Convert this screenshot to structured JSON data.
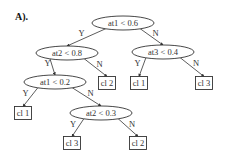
{
  "panel_label": "A).",
  "nodes": [
    {
      "id": "n0",
      "type": "decision",
      "label": "at1 < 0.6",
      "cx": 123,
      "cy": 23
    },
    {
      "id": "n1",
      "type": "decision",
      "label": "at2 < 0.8",
      "cx": 67,
      "cy": 53
    },
    {
      "id": "n2",
      "type": "decision",
      "label": "at3 < 0.4",
      "cx": 163,
      "cy": 52
    },
    {
      "id": "n3",
      "type": "decision",
      "label": "at1 < 0.2",
      "cx": 55,
      "cy": 82
    },
    {
      "id": "n4",
      "type": "leaf",
      "label": "cl 2",
      "cx": 107,
      "cy": 83
    },
    {
      "id": "n5",
      "type": "leaf",
      "label": "cl 1",
      "cx": 139,
      "cy": 83
    },
    {
      "id": "n6",
      "type": "leaf",
      "label": "cl 3",
      "cx": 204,
      "cy": 83
    },
    {
      "id": "n7",
      "type": "leaf",
      "label": "cl 1",
      "cx": 23,
      "cy": 113
    },
    {
      "id": "n8",
      "type": "decision",
      "label": "at2 < 0.3",
      "cx": 101,
      "cy": 113
    },
    {
      "id": "n9",
      "type": "leaf",
      "label": "cl 3",
      "cx": 72,
      "cy": 143
    },
    {
      "id": "n10",
      "type": "leaf",
      "label": "cl 2",
      "cx": 138,
      "cy": 143
    }
  ],
  "edges": [
    {
      "from": "n0",
      "to": "n1",
      "label": "Y"
    },
    {
      "from": "n0",
      "to": "n2",
      "label": "N"
    },
    {
      "from": "n1",
      "to": "n3",
      "label": "Y"
    },
    {
      "from": "n1",
      "to": "n4",
      "label": "N"
    },
    {
      "from": "n2",
      "to": "n5",
      "label": "Y"
    },
    {
      "from": "n2",
      "to": "n6",
      "label": "N"
    },
    {
      "from": "n3",
      "to": "n7",
      "label": "Y"
    },
    {
      "from": "n3",
      "to": "n8",
      "label": "N"
    },
    {
      "from": "n8",
      "to": "n9",
      "label": "Y"
    },
    {
      "from": "n8",
      "to": "n10",
      "label": "N"
    }
  ],
  "style": {
    "stroke": "#333333",
    "background": "#ffffff"
  }
}
